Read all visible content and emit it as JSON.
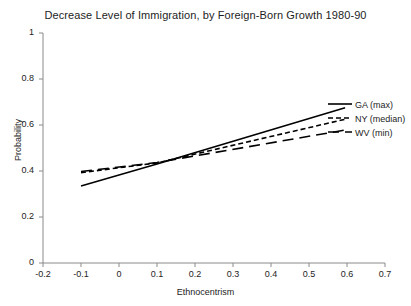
{
  "chart_data": {
    "type": "line",
    "title": "Decrease Level of Immigration, by Foreign-Born Growth 1980-90",
    "xlabel": "Ethnocentrism",
    "ylabel": "Probability",
    "xlim": [
      -0.2,
      0.7
    ],
    "ylim": [
      0,
      1
    ],
    "xticks": [
      "-0.2",
      "-0.1",
      "0",
      "0.1",
      "0.2",
      "0.3",
      "0.4",
      "0.5",
      "0.6",
      "0.7"
    ],
    "xtick_values": [
      -0.2,
      -0.1,
      0,
      0.1,
      0.2,
      0.3,
      0.4,
      0.5,
      0.6,
      0.7
    ],
    "yticks": [
      "0",
      "0.2",
      "0.4",
      "0.6",
      "0.8",
      "1"
    ],
    "ytick_values": [
      0,
      0.2,
      0.4,
      0.6,
      0.8,
      1
    ],
    "grid": false,
    "legend_position": "right-inside",
    "series": [
      {
        "name": "GA (max)",
        "style": "solid",
        "x": [
          -0.1,
          0.1,
          0.595
        ],
        "values": [
          0.335,
          0.43,
          0.675
        ]
      },
      {
        "name": "NY (median)",
        "style": "dotted",
        "x": [
          -0.1,
          0.1,
          0.595
        ],
        "values": [
          0.393,
          0.435,
          0.625
        ]
      },
      {
        "name": "WV (min)",
        "style": "dashed",
        "x": [
          -0.1,
          0.1,
          0.595
        ],
        "values": [
          0.398,
          0.437,
          0.578
        ]
      }
    ]
  },
  "legend": {
    "items": [
      {
        "label": "GA (max)"
      },
      {
        "label": "NY (median)"
      },
      {
        "label": "WV (min)"
      }
    ]
  },
  "axis": {
    "y_tick_labels": [
      "1",
      "0.8",
      "0.6",
      "0.4",
      "0.2",
      "0"
    ],
    "x_tick_labels": [
      "-0.2",
      "-0.1",
      "0",
      "0.1",
      "0.2",
      "0.3",
      "0.4",
      "0.5",
      "0.6",
      "0.7"
    ]
  },
  "colors": {
    "line": "#000000",
    "axis": "#8a8a8a",
    "text": "#1d1d1d",
    "background": "#ffffff"
  }
}
